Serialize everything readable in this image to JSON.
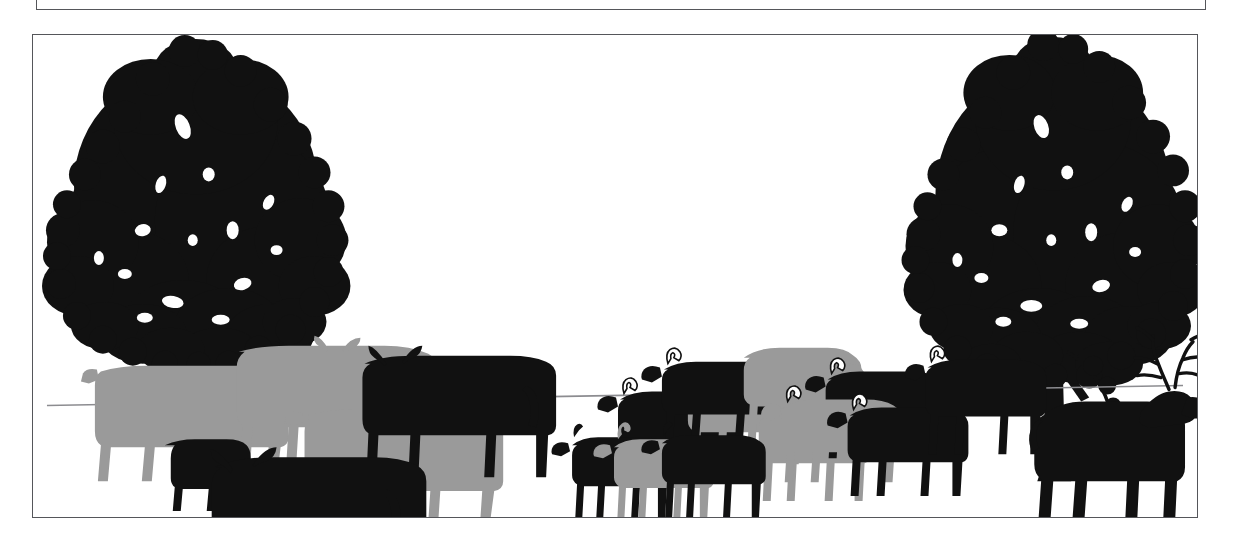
{
  "figure": {
    "caption": "",
    "background_color": "#ffffff",
    "frame_color": "#55565a",
    "ink_black": "#111111",
    "ink_gray": "#9a9a9a",
    "horizon_color": "#8c8c90"
  },
  "upper_frame": {
    "name": "partial-figure-box-above",
    "description": "Bottom edge of the preceding framed figure"
  },
  "scene": {
    "horizon": {
      "name": "horizon-line",
      "description": "Thin ground line sloping slightly upward to the right",
      "left_y": 372,
      "right_y": 352
    },
    "trees": [
      {
        "id": "tree-left",
        "label": "Left broadleaf tree silhouette",
        "color": "#111111",
        "trunk_base_x": 162,
        "canopy_top_y": 12
      },
      {
        "id": "tree-right",
        "label": "Right broadleaf tree silhouette",
        "color": "#111111",
        "trunk_base_x": 1022,
        "canopy_top_y": 6
      }
    ],
    "animal_groups": [
      {
        "id": "group-cattle",
        "label": "Cattle herd",
        "count": 6,
        "members": [
          {
            "id": "cow-1",
            "label": "Gray cow, rear left",
            "color": "#9a9a9a"
          },
          {
            "id": "cow-2",
            "label": "Gray cow, upper middle",
            "color": "#9a9a9a"
          },
          {
            "id": "cow-3",
            "label": "Gray cow, front right",
            "color": "#9a9a9a"
          },
          {
            "id": "cow-4",
            "label": "Black horned cow, rear right",
            "color": "#111111"
          },
          {
            "id": "cow-5",
            "label": "Black horned cow, foreground",
            "color": "#111111"
          },
          {
            "id": "cow-6",
            "label": "Black calf behind gray cow",
            "color": "#111111"
          }
        ]
      },
      {
        "id": "group-sheep",
        "label": "Sheep and rams flock",
        "count": 9,
        "members": [
          {
            "id": "ram-1",
            "label": "Black ram, far left",
            "color": "#111111",
            "horned": true
          },
          {
            "id": "ram-2",
            "label": "Gray horned ram",
            "color": "#9a9a9a",
            "horned": true
          },
          {
            "id": "ram-3",
            "label": "Black horned ram, upper",
            "color": "#111111",
            "horned": true
          },
          {
            "id": "sheep-4",
            "label": "Gray hornless ewe, center",
            "color": "#9a9a9a",
            "horned": false
          },
          {
            "id": "sheep-5",
            "label": "Gray lamb, foreground",
            "color": "#9a9a9a",
            "horned": false
          },
          {
            "id": "ram-6",
            "label": "Black horned ram, middle",
            "color": "#111111",
            "horned": true
          },
          {
            "id": "ram-7",
            "label": "Gray horned ram, right",
            "color": "#9a9a9a",
            "horned": true
          },
          {
            "id": "ram-8",
            "label": "Black horned ram, lower right",
            "color": "#111111",
            "horned": true
          },
          {
            "id": "ram-9",
            "label": "Black horned ram, far right",
            "color": "#111111",
            "horned": true
          }
        ]
      },
      {
        "id": "group-goats",
        "label": "Goat group in foreground",
        "count": 3,
        "members": [
          {
            "id": "goat-1",
            "label": "Black goat, left",
            "color": "#111111"
          },
          {
            "id": "goat-2",
            "label": "Gray goat, center",
            "color": "#9a9a9a"
          },
          {
            "id": "goat-3",
            "label": "Black goat, right",
            "color": "#111111"
          }
        ]
      },
      {
        "id": "group-deer",
        "label": "Deer",
        "count": 1,
        "members": [
          {
            "id": "stag-1",
            "label": "Black antlered stag beneath right tree",
            "color": "#111111"
          }
        ]
      }
    ]
  }
}
